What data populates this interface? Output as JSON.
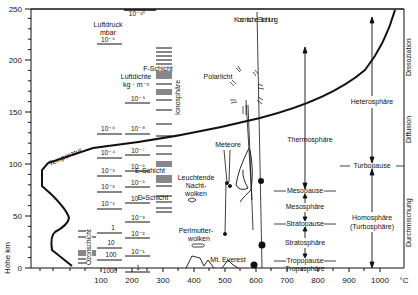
{
  "axes": {
    "y_label": "Höhe km",
    "y_ticks": [
      "0",
      "50",
      "100",
      "150",
      "200",
      "250"
    ],
    "x_ticks": [
      "100",
      "200",
      "300",
      "400",
      "500",
      "600",
      "700",
      "800",
      "900",
      "1000"
    ],
    "x_unit": "°C"
  },
  "pressure": {
    "title": "Luftdruck",
    "unit": "mbar",
    "values": [
      "10⁻⁶",
      "10⁻⁵",
      "10⁻⁴",
      "10⁻³",
      "10⁻²",
      "10⁻¹",
      "1",
      "10",
      "100",
      "1000"
    ]
  },
  "density": {
    "title": "Luftdichte",
    "unit": "kg · m⁻³",
    "values": [
      "10⁻¹⁰",
      "10⁻⁹",
      "10⁻⁸",
      "10⁻⁷",
      "10⁻⁶",
      "10⁻⁵",
      "10⁻⁴",
      "10⁻³",
      "10⁻²",
      "10⁻¹",
      "1"
    ]
  },
  "ionosphere": {
    "label": "Ionosphäre",
    "f_layer": "F-Schicht",
    "e_layer": "E-Schicht",
    "d_layer": "D-Schicht"
  },
  "ozone": {
    "label": "Ozonschicht"
  },
  "curve": {
    "label": "Temperatur"
  },
  "phenomena": {
    "cosmic": "Kosmische Strahlung",
    "aurora": "Polarlicht",
    "meteors": "Meteore",
    "nlc": [
      "Leuchtende",
      "Nacht-",
      "wolken"
    ],
    "psc": [
      "Perlmutter-",
      "wolken"
    ],
    "everest": "Mt. Everest"
  },
  "layers": {
    "thermosphere": "Thermosphäre",
    "mesopause": "Mesopause",
    "mesosphere": "Mesosphäre",
    "stratopause": "Stratopause",
    "stratosphere": "Stratosphäre",
    "tropopause": "Tropopause",
    "troposphere": "Troposphäre",
    "heterosphere": "Heterosphäre",
    "turbopause": "Turbopause",
    "homosphere": "Homosphäre",
    "turbosphere": "(Turbosphäre)"
  },
  "processes": {
    "dissociation": "Dissoziation",
    "diffusion": "Diffusion",
    "mixing": "Durchmischung"
  }
}
